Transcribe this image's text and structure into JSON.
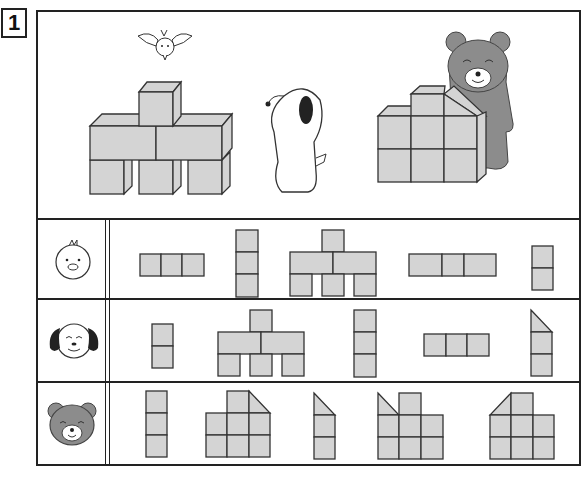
{
  "problem": {
    "number": "1"
  },
  "scene": {
    "characters": [
      "bird",
      "dog",
      "bear"
    ],
    "structures": [
      {
        "name": "stack-left",
        "description": "3 cubes bottom, 2 long blocks middle, 1 cube top"
      },
      {
        "name": "stack-right",
        "description": "3x2 cube base, cube on top, slanted prism"
      }
    ]
  },
  "rows": [
    {
      "viewer": "chick",
      "icon": "chick-face-icon",
      "options": [
        "row-of-3",
        "column-of-3",
        "front-view-stack",
        "row-of-3-variant",
        "column-of-2"
      ]
    },
    {
      "viewer": "dog",
      "icon": "dog-face-icon",
      "options": [
        "column-of-2",
        "front-view-stack",
        "column-of-3",
        "row-of-3",
        "column-of-2-with-slant"
      ]
    },
    {
      "viewer": "bear",
      "icon": "bear-face-icon",
      "options": [
        "column-of-3",
        "grid-with-slant-right",
        "column-of-2-with-slant",
        "grid-with-slant-left",
        "grid-with-slant-leftup"
      ]
    }
  ],
  "colors": {
    "block_fill": "#d4d4d4",
    "outline": "#333333",
    "bear": "#8c8c8c",
    "dog_ear": "#222222"
  }
}
